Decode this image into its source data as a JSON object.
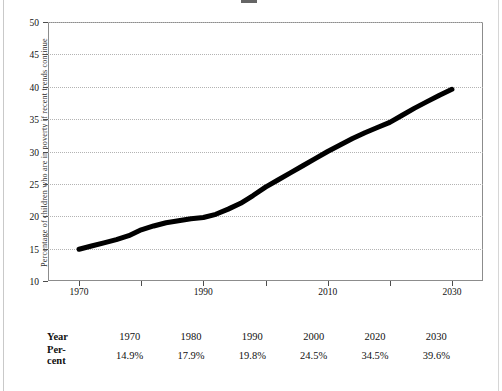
{
  "figure": {
    "title_clipped": "",
    "background_color": "#ffffff",
    "frame_color": "#8c8c8c",
    "series_color": "#000000",
    "gridline_color": "#b3b3b3"
  },
  "chart_data": {
    "type": "line",
    "title": "",
    "xlabel": "",
    "ylabel": "Percentage of children who are in poverty if recent trends continue",
    "xlim": [
      1965,
      2035
    ],
    "ylim": [
      10,
      50
    ],
    "grid": true,
    "legend": "none",
    "x_ticks": [
      1970,
      1980,
      1990,
      2000,
      2010,
      2020,
      2030
    ],
    "x_tick_labels": [
      "1970",
      "",
      "1990",
      "",
      "2010",
      "",
      "2030"
    ],
    "y_ticks": [
      10,
      15,
      20,
      25,
      30,
      35,
      40,
      45,
      50
    ],
    "y_tick_labels": [
      "10",
      "15",
      "20",
      "25",
      "30",
      "35",
      "40",
      "45",
      "50"
    ],
    "series": [
      {
        "name": "Children in poverty (%)",
        "x": [
          1970,
          1972,
          1974,
          1976,
          1978,
          1980,
          1982,
          1984,
          1986,
          1988,
          1990,
          1992,
          1994,
          1996,
          1998,
          2000,
          2002,
          2004,
          2006,
          2008,
          2010,
          2012,
          2014,
          2016,
          2018,
          2020,
          2022,
          2024,
          2026,
          2028,
          2030
        ],
        "values": [
          14.9,
          15.4,
          15.9,
          16.4,
          17.0,
          17.9,
          18.5,
          19.0,
          19.3,
          19.6,
          19.8,
          20.3,
          21.1,
          22.0,
          23.2,
          24.5,
          25.6,
          26.7,
          27.8,
          28.9,
          30.0,
          31.0,
          32.0,
          32.9,
          33.7,
          34.5,
          35.6,
          36.7,
          37.7,
          38.7,
          39.6
        ]
      }
    ]
  },
  "table": {
    "row_labels": [
      "Year",
      "Per-\ncent"
    ],
    "years": [
      "1970",
      "1980",
      "1990",
      "2000",
      "2020",
      "2030"
    ],
    "percents": [
      "14.9%",
      "17.9%",
      "19.8%",
      "24.5%",
      "34.5%",
      "39.6%"
    ]
  }
}
